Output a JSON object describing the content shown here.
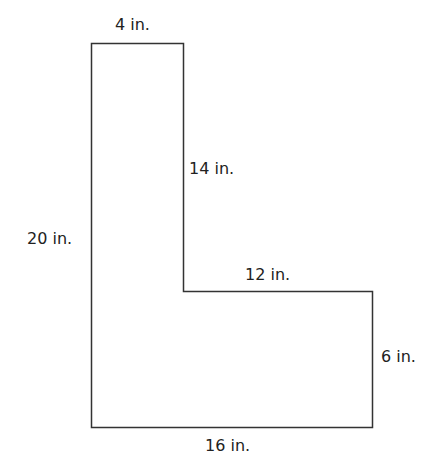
{
  "figure": {
    "shape": "L-shaped polygon",
    "stroke_color": "#333333",
    "fill_color": "#ffffff",
    "labels": {
      "top": "4 in.",
      "inner_vertical": "14 in.",
      "left": "20 in.",
      "inner_horizontal": "12 in.",
      "right": "6 in.",
      "bottom": "16 in."
    }
  }
}
